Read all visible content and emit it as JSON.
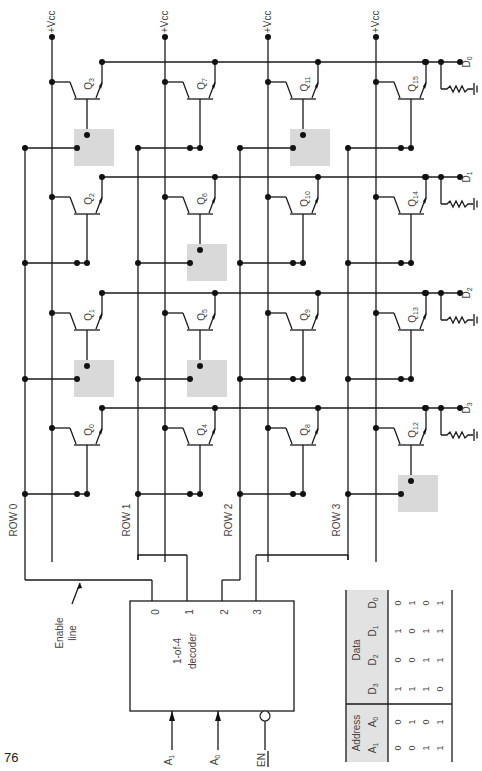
{
  "page_number": "76",
  "supply_label": "+Vcc",
  "vcc_columns": [
    "+VCC",
    "+VCC",
    "+VCC",
    "+VCC"
  ],
  "data_outputs": [
    "D0",
    "D1",
    "D2",
    "D3"
  ],
  "rows": [
    "ROW 0",
    "ROW 1",
    "ROW 2",
    "ROW 3"
  ],
  "transistors": [
    {
      "id": "Q3",
      "row": 0,
      "bit": 0,
      "stored": 0
    },
    {
      "id": "Q2",
      "row": 0,
      "bit": 1,
      "stored": 1
    },
    {
      "id": "Q1",
      "row": 0,
      "bit": 2,
      "stored": 0
    },
    {
      "id": "Q0",
      "row": 0,
      "bit": 3,
      "stored": 1
    },
    {
      "id": "Q7",
      "row": 1,
      "bit": 0,
      "stored": 1
    },
    {
      "id": "Q6",
      "row": 1,
      "bit": 1,
      "stored": 0
    },
    {
      "id": "Q5",
      "row": 1,
      "bit": 2,
      "stored": 0
    },
    {
      "id": "Q4",
      "row": 1,
      "bit": 3,
      "stored": 1
    },
    {
      "id": "Q11",
      "row": 2,
      "bit": 0,
      "stored": 0
    },
    {
      "id": "Q10",
      "row": 2,
      "bit": 1,
      "stored": 1
    },
    {
      "id": "Q9",
      "row": 2,
      "bit": 2,
      "stored": 1
    },
    {
      "id": "Q8",
      "row": 2,
      "bit": 3,
      "stored": 1
    },
    {
      "id": "Q15",
      "row": 3,
      "bit": 0,
      "stored": 1
    },
    {
      "id": "Q14",
      "row": 3,
      "bit": 1,
      "stored": 1
    },
    {
      "id": "Q13",
      "row": 3,
      "bit": 2,
      "stored": 1
    },
    {
      "id": "Q12",
      "row": 3,
      "bit": 3,
      "stored": 0
    }
  ],
  "decoder": {
    "title_line1": "1-of-4",
    "title_line2": "decoder",
    "outputs": [
      "0",
      "1",
      "2",
      "3"
    ],
    "inputs": [
      "A1",
      "A0",
      "EN"
    ],
    "enable_annotation_line1": "Enable",
    "enable_annotation_line2": "line"
  },
  "truth_table": {
    "group_headers": [
      "Address",
      "Data"
    ],
    "columns": [
      "A1",
      "A0",
      "D3",
      "D2",
      "D1",
      "D0"
    ],
    "rows": [
      [
        "0",
        "0",
        "1",
        "0",
        "1",
        "0"
      ],
      [
        "0",
        "1",
        "1",
        "0",
        "0",
        "1"
      ],
      [
        "1",
        "0",
        "1",
        "1",
        "1",
        "0"
      ],
      [
        "1",
        "1",
        "0",
        "1",
        "1",
        "1"
      ]
    ]
  }
}
